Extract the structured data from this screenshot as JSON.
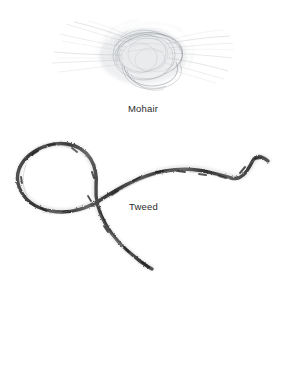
{
  "page": {
    "background_color": "#ffffff",
    "width": 286,
    "height": 369
  },
  "specimens": [
    {
      "id": "mohair",
      "label": "Mohair",
      "kind": "yarn-fiber-photograph",
      "description": "loose halo of fine translucent mohair fibers tangled into a soft open coil with stray hairs radiating left and right",
      "fiber_color": "#9aa0a6",
      "fiber_color_dark": "#6e747a",
      "label_x": 146,
      "label_y": 112,
      "bounds": {
        "x": 50,
        "y": 18,
        "width": 185,
        "height": 78
      }
    },
    {
      "id": "tweed",
      "label": "Tweed",
      "kind": "yarn-strand-photograph",
      "description": "single thick mottled tweed yarn forming an oval loop at left that crosses itself, with a tail descending to lower centre and a long strand extending to the right ending in a zigzag peak",
      "yarn_color": "#4a4a4a",
      "yarn_color_dark": "#262626",
      "yarn_color_light": "#8d8d8d",
      "label_x": 146,
      "label_y": 210,
      "bounds": {
        "x": 16,
        "y": 135,
        "width": 254,
        "height": 140
      }
    }
  ]
}
